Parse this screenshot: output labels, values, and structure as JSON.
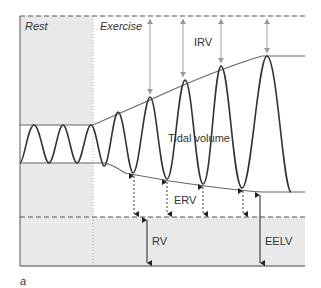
{
  "figure": {
    "panel_label": "a",
    "region_labels": {
      "rest": "Rest",
      "exercise": "Exercise"
    },
    "volume_labels": {
      "irv": "IRV",
      "tidal_volume": "Tidal volume",
      "erv": "ERV",
      "rv": "RV",
      "eelv": "EELV"
    },
    "colors": {
      "line": "#444444",
      "shade": "#e9e9e9",
      "arrow_light": "#999999",
      "text": "#333333"
    }
  }
}
